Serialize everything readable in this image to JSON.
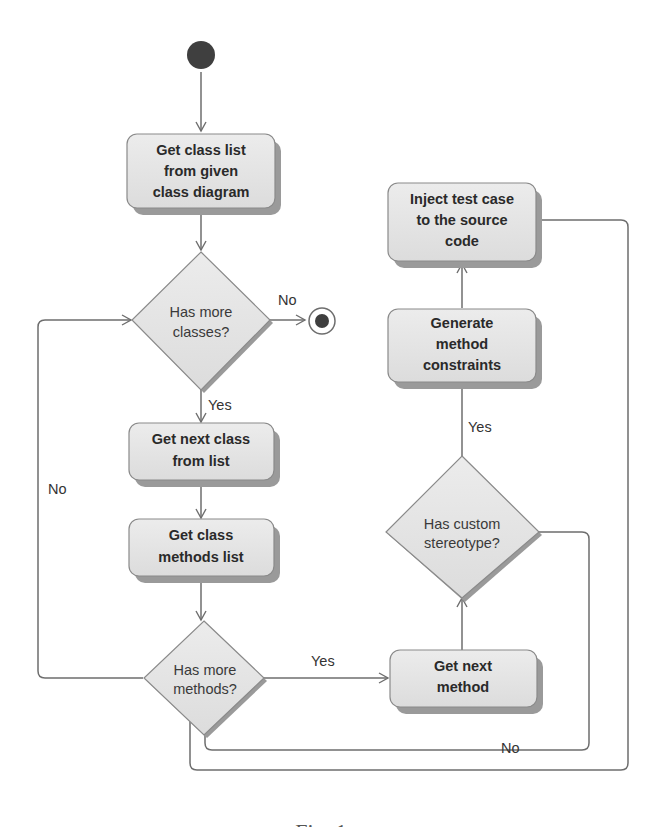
{
  "diagram": {
    "type": "UML activity diagram",
    "colors": {
      "node_fill": "#e4e4e4",
      "node_stroke": "#8a8a8a",
      "shadow": "#9a9a9a",
      "edge": "#6e6e6e",
      "initial_node": "#3f3f3f",
      "text": "#2a2a2a"
    },
    "nodes": {
      "start": {
        "kind": "initial"
      },
      "get_class_list": {
        "kind": "action",
        "lines": [
          "Get class list",
          "from given",
          "class diagram"
        ]
      },
      "has_more_classes": {
        "kind": "decision",
        "lines": [
          "Has more",
          "classes?"
        ]
      },
      "end": {
        "kind": "final"
      },
      "get_next_class": {
        "kind": "action",
        "lines": [
          "Get next class",
          "from list"
        ]
      },
      "get_class_methods": {
        "kind": "action",
        "lines": [
          "Get class",
          "methods list"
        ]
      },
      "has_more_methods": {
        "kind": "decision",
        "lines": [
          "Has more",
          "methods?"
        ]
      },
      "get_next_method": {
        "kind": "action",
        "lines": [
          "Get next",
          "method"
        ]
      },
      "has_custom_stereotype": {
        "kind": "decision",
        "lines": [
          "Has custom",
          "stereotype?"
        ]
      },
      "generate_constraints": {
        "kind": "action",
        "lines": [
          "Generate",
          "method",
          "constraints"
        ]
      },
      "inject_test_case": {
        "kind": "action",
        "lines": [
          "Inject test case",
          "to the source",
          "code"
        ]
      }
    },
    "edge_labels": {
      "classes_no": "No",
      "classes_yes": "Yes",
      "methods_no": "No",
      "methods_yes": "Yes",
      "stereotype_yes": "Yes",
      "stereotype_no": "No"
    }
  },
  "caption": {
    "text": "Fig. 1 ..."
  }
}
